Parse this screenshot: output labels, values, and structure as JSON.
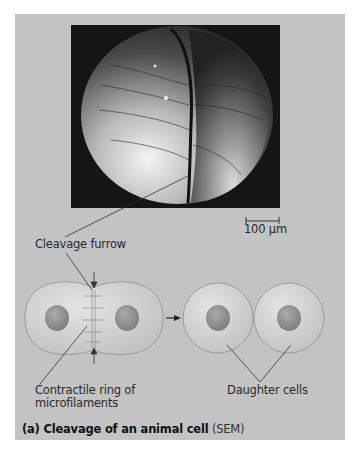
{
  "figure": {
    "caption_bold": "(a) Cleavage of an animal cell",
    "caption_normal": "(SEM)",
    "scale_bar": {
      "label": "100 µm"
    },
    "labels": {
      "cleavage_furrow": "Cleavage furrow",
      "contractile_ring_line1": "Contractile ring of",
      "contractile_ring_line2": "microfilaments",
      "daughter_cells": "Daughter cells"
    },
    "colors": {
      "panel_background": "#c3c3c3",
      "sem_background": "#151515",
      "cell_fill": "#cfd2cf",
      "nucleus_fill": "#8e918e",
      "line": "#333333"
    }
  }
}
